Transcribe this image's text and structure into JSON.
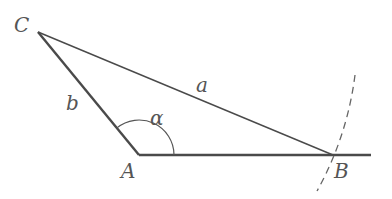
{
  "diagram": {
    "type": "triangle-construction",
    "colors": {
      "line": "#4a4a4a",
      "thin_line": "#555555",
      "label": "#555555",
      "dashed_arc": "#666666"
    },
    "vertices": {
      "A": {
        "label": "A",
        "x": 139,
        "y": 155
      },
      "B": {
        "label": "B",
        "x": 333,
        "y": 155
      },
      "C": {
        "label": "C",
        "x": 38,
        "y": 32
      }
    },
    "sides": {
      "a": {
        "label": "a",
        "from": "C",
        "to": "B"
      },
      "b": {
        "label": "b",
        "from": "C",
        "to": "A"
      },
      "base": {
        "from": "A",
        "to_x": 371,
        "note": "ray from A through B"
      }
    },
    "angle": {
      "label": "α",
      "vertex": "A",
      "radius": 35
    },
    "arc": {
      "style": "dashed",
      "center": "C",
      "radius_label": "a"
    }
  }
}
